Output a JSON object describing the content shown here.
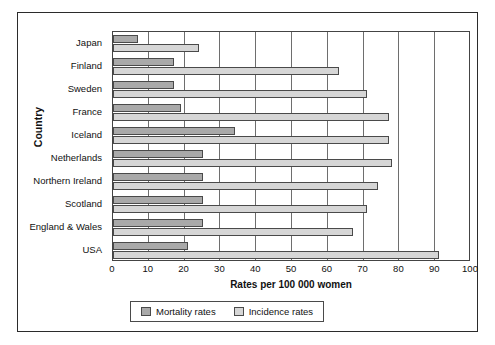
{
  "chart_data": {
    "type": "bar",
    "orientation": "horizontal",
    "title": "",
    "xlabel": "Rates per 100 000  women",
    "ylabel": "Country",
    "xlim": [
      0,
      100
    ],
    "xticks": [
      0,
      10,
      20,
      30,
      40,
      50,
      60,
      70,
      80,
      90,
      100
    ],
    "grid": true,
    "legend_position": "bottom",
    "categories": [
      "Japan",
      "Finland",
      "Sweden",
      "France",
      "Iceland",
      "Netherlands",
      "Northern Ireland",
      "Scotland",
      "England & Wales",
      "USA"
    ],
    "series": [
      {
        "name": "Mortality rates",
        "color": "#a9a9a9",
        "values": [
          7,
          17,
          17,
          19,
          34,
          25,
          25,
          25,
          25,
          21
        ]
      },
      {
        "name": "Incidence rates",
        "color": "#d6d6d6",
        "values": [
          24,
          63,
          71,
          77,
          77,
          78,
          74,
          71,
          67,
          91
        ]
      }
    ]
  },
  "legend": {
    "items": [
      {
        "label": "Mortality rates",
        "swatch": "mortality"
      },
      {
        "label": "Incidence rates",
        "swatch": "incidence"
      }
    ]
  }
}
